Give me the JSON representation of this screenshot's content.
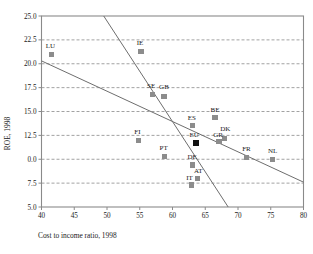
{
  "chart_data": {
    "type": "scatter",
    "title": "",
    "xlabel": "Cost to income ratio, 1998",
    "ylabel": "ROE, 1998",
    "xlim": [
      40,
      80
    ],
    "ylim": [
      5.0,
      25.0
    ],
    "xticks": [
      "40",
      "45",
      "50",
      "55",
      "60",
      "65",
      "70",
      "75",
      "80"
    ],
    "yticks": [
      "25.0",
      "22.5",
      "20.0",
      "17.5",
      "15.0",
      "12.5",
      "0.0",
      "7.5",
      "5.0"
    ],
    "ytick_values": [
      25.0,
      22.5,
      20.0,
      17.5,
      15.0,
      12.5,
      10.0,
      7.5,
      5.0
    ],
    "grid": "horizontal-dashed",
    "legend": "none",
    "marker_color": "#8c8c8c",
    "highlight_color": "#111111",
    "line_color": "#6e6e6e",
    "axis_color": "#8a8a8a",
    "points": [
      {
        "label": "LU",
        "x": 41.5,
        "y": 21.0,
        "highlight": false,
        "label_dx": -1,
        "label_dy": -6
      },
      {
        "label": "IE",
        "x": 55.2,
        "y": 21.3,
        "highlight": false,
        "label_dx": -1,
        "label_dy": -6
      },
      {
        "label": "SE",
        "x": 56.9,
        "y": 16.8,
        "highlight": false,
        "label_dx": -1,
        "label_dy": -6.5
      },
      {
        "label": "GB",
        "x": 58.7,
        "y": 16.6,
        "highlight": false,
        "label_dx": 0,
        "label_dy": -7
      },
      {
        "label": "BE",
        "x": 66.5,
        "y": 14.4,
        "highlight": false,
        "label_dx": 0,
        "label_dy": -5.5
      },
      {
        "label": "ES",
        "x": 63.1,
        "y": 13.5,
        "highlight": false,
        "label_dx": -1,
        "label_dy": -6
      },
      {
        "label": "FI",
        "x": 54.8,
        "y": 12.0,
        "highlight": false,
        "label_dx": -1,
        "label_dy": -6
      },
      {
        "label": "DK",
        "x": 67.9,
        "y": 12.2,
        "highlight": false,
        "label_dx": 1,
        "label_dy": -7
      },
      {
        "label": "GR",
        "x": 67.1,
        "y": 11.9,
        "highlight": false,
        "label_dx": -1,
        "label_dy": -4.5
      },
      {
        "label": "EU",
        "x": 63.6,
        "y": 11.7,
        "highlight": true,
        "label_dx": -2,
        "label_dy": -6
      },
      {
        "label": "FR",
        "x": 71.3,
        "y": 10.2,
        "highlight": false,
        "label_dx": 0,
        "label_dy": -6
      },
      {
        "label": "NL",
        "x": 75.3,
        "y": 10.0,
        "highlight": false,
        "label_dx": 0,
        "label_dy": -6
      },
      {
        "label": "PT",
        "x": 58.8,
        "y": 10.3,
        "highlight": false,
        "label_dx": -1,
        "label_dy": -6
      },
      {
        "label": "DE",
        "x": 63.0,
        "y": 9.4,
        "highlight": false,
        "label_dx": 0,
        "label_dy": -6
      },
      {
        "label": "AT",
        "x": 63.8,
        "y": 8.0,
        "highlight": false,
        "label_dx": 1,
        "label_dy": -5
      },
      {
        "label": "IT",
        "x": 62.9,
        "y": 7.3,
        "highlight": false,
        "label_dx": -2,
        "label_dy": -5
      }
    ],
    "trend_lines": [
      {
        "name": "upper-trend-line",
        "x1": 49.5,
        "y1": 25.0,
        "x2": 68.5,
        "y2": 5.0
      },
      {
        "name": "lower-trend-line",
        "x1": 40.0,
        "y1": 20.3,
        "x2": 80.0,
        "y2": 7.6
      }
    ]
  }
}
